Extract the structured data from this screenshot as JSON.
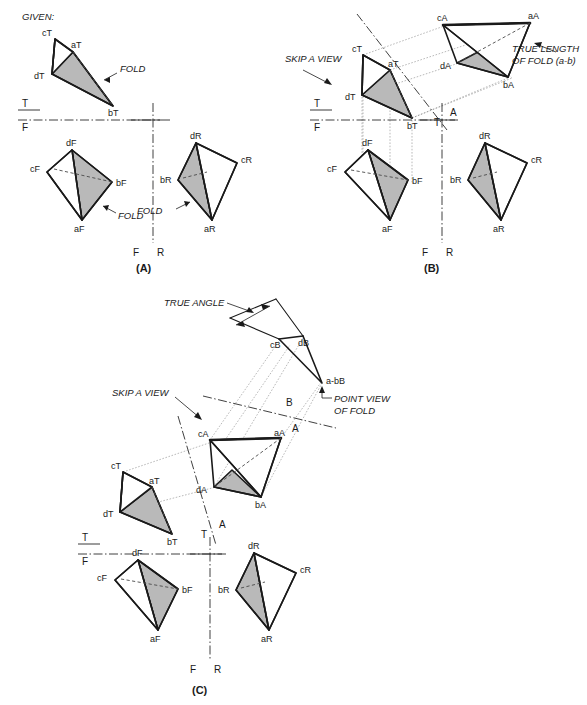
{
  "figure": {
    "given_label": "GIVEN:",
    "panels": [
      {
        "id": "A",
        "label": "(A)"
      },
      {
        "id": "B",
        "label": "(B)"
      },
      {
        "id": "C",
        "label": "(C)"
      }
    ]
  },
  "notes": {
    "fold": "FOLD",
    "skip_a_view": "SKIP A VIEW",
    "true_length_of_fold": "TRUE LENGTH\nOF FOLD (a-b)",
    "true_length_line1": "TRUE LENGTH",
    "true_length_line2": "OF FOLD (a-b)",
    "true_angle": "TRUE ANGLE",
    "point_view_line1": "POINT VIEW",
    "point_view_line2": "OF FOLD"
  },
  "fold_lines": {
    "tf_top": "T",
    "tf_bottom": "F",
    "fr_front": "F",
    "fr_right": "R",
    "ta_top": "T",
    "ta_aux": "A",
    "ab_aux": "A",
    "ab_second": "B"
  },
  "panelA": {
    "panel_label": "(A)",
    "top_view": {
      "view_code": "T",
      "vertices": [
        {
          "name": "cT",
          "x": 55,
          "y": 39
        },
        {
          "name": "aT",
          "x": 73,
          "y": 52
        },
        {
          "name": "dT",
          "x": 52,
          "y": 74
        },
        {
          "name": "bT",
          "x": 113,
          "y": 106
        }
      ]
    },
    "front_view": {
      "view_code": "F",
      "vertices": [
        {
          "name": "dF",
          "x": 72,
          "y": 150
        },
        {
          "name": "cF",
          "x": 47,
          "y": 172
        },
        {
          "name": "bF",
          "x": 112,
          "y": 182
        },
        {
          "name": "aF",
          "x": 82,
          "y": 220
        }
      ]
    },
    "right_view": {
      "view_code": "R",
      "vertices": [
        {
          "name": "dR",
          "x": 196,
          "y": 143
        },
        {
          "name": "cR",
          "x": 237,
          "y": 163
        },
        {
          "name": "bR",
          "x": 178,
          "y": 180
        },
        {
          "name": "aR",
          "x": 212,
          "y": 220
        }
      ]
    },
    "fold_callouts": [
      "FOLD",
      "FOLD",
      "FOLD"
    ]
  },
  "panelB": {
    "panel_label": "(B)",
    "top_view": {
      "view_code": "T",
      "vertices": [
        {
          "name": "cT",
          "x": 363,
          "y": 55
        },
        {
          "name": "aT",
          "x": 390,
          "y": 70
        },
        {
          "name": "dT",
          "x": 362,
          "y": 95
        },
        {
          "name": "bT",
          "x": 412,
          "y": 118
        }
      ]
    },
    "aux_view": {
      "view_code": "A",
      "vertices": [
        {
          "name": "cA",
          "x": 443,
          "y": 25
        },
        {
          "name": "aA",
          "x": 530,
          "y": 23
        },
        {
          "name": "dA",
          "x": 457,
          "y": 63
        },
        {
          "name": "bA",
          "x": 508,
          "y": 77
        }
      ]
    },
    "front_view": {
      "view_code": "F",
      "vertices": [
        {
          "name": "dF",
          "x": 368,
          "y": 150
        },
        {
          "name": "cF",
          "x": 345,
          "y": 172
        },
        {
          "name": "bF",
          "x": 408,
          "y": 180
        },
        {
          "name": "aF",
          "x": 390,
          "y": 220
        }
      ]
    },
    "right_view": {
      "view_code": "R",
      "vertices": [
        {
          "name": "dR",
          "x": 485,
          "y": 143
        },
        {
          "name": "cR",
          "x": 527,
          "y": 163
        },
        {
          "name": "bR",
          "x": 468,
          "y": 180
        },
        {
          "name": "aR",
          "x": 501,
          "y": 220
        }
      ]
    },
    "annotations": [
      "SKIP A VIEW",
      "TRUE LENGTH",
      "OF FOLD (a-b)"
    ]
  },
  "panelC": {
    "panel_label": "(C)",
    "top_view": {
      "view_code": "T",
      "vertices": [
        {
          "name": "cT",
          "x": 123,
          "y": 472
        },
        {
          "name": "aT",
          "x": 152,
          "y": 487
        },
        {
          "name": "dT",
          "x": 120,
          "y": 512
        },
        {
          "name": "bT",
          "x": 172,
          "y": 534
        }
      ]
    },
    "aux_view_a": {
      "view_code": "A",
      "vertices": [
        {
          "name": "cA",
          "x": 210,
          "y": 440
        },
        {
          "name": "aA",
          "x": 281,
          "y": 438
        },
        {
          "name": "dA",
          "x": 214,
          "y": 487
        },
        {
          "name": "bA",
          "x": 261,
          "y": 497
        }
      ]
    },
    "aux_view_b": {
      "view_code": "B",
      "vertices": [
        {
          "name": "cB",
          "x": 279,
          "y": 339
        },
        {
          "name": "dB",
          "x": 303,
          "y": 336
        },
        {
          "name": "a-bB",
          "x": 322,
          "y": 383
        }
      ]
    },
    "front_view": {
      "view_code": "F",
      "vertices": [
        {
          "name": "dF",
          "x": 138,
          "y": 560
        },
        {
          "name": "cF",
          "x": 115,
          "y": 580
        },
        {
          "name": "bF",
          "x": 178,
          "y": 589
        },
        {
          "name": "aF",
          "x": 158,
          "y": 630
        }
      ]
    },
    "right_view": {
      "view_code": "R",
      "vertices": [
        {
          "name": "dR",
          "x": 254,
          "y": 553
        },
        {
          "name": "cR",
          "x": 296,
          "y": 573
        },
        {
          "name": "bR",
          "x": 236,
          "y": 590
        },
        {
          "name": "aR",
          "x": 269,
          "y": 630
        }
      ]
    },
    "annotations": [
      "TRUE ANGLE",
      "SKIP A VIEW",
      "POINT VIEW",
      "OF FOLD"
    ]
  },
  "colors": {
    "face_gray": "#b9b9b9",
    "line_black": "#1a1a1a",
    "hidden_gray": "#4a4a4a",
    "projection_gray": "#8a8a8a",
    "background": "#ffffff"
  }
}
